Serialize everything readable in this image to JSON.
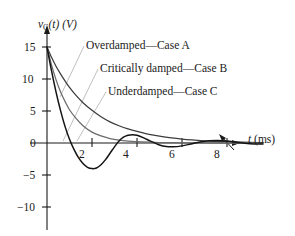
{
  "figure": {
    "y_axis_title_main": "v",
    "y_axis_title_sub": "C",
    "y_axis_title_rest": "(t) (V)",
    "x_axis_title_main": "t",
    "x_axis_title_rest": " (ms)"
  },
  "chart_data": {
    "type": "line",
    "title": "",
    "xlabel": "t (ms)",
    "ylabel": "v_C(t) (V)",
    "xlim": [
      0,
      9.6
    ],
    "ylim": [
      -10,
      16
    ],
    "xticks": [
      2,
      4,
      6,
      8
    ],
    "yticks": [
      15,
      10,
      5,
      0,
      -5,
      -10
    ],
    "xtick_labels": [
      "2",
      "4",
      "6",
      "8"
    ],
    "ytick_labels": [
      "15",
      "10",
      "5",
      "0",
      "−5",
      "−10"
    ],
    "grid": false,
    "legend_position": "inline-annotations",
    "initial_value": 15,
    "series": [
      {
        "name": "Overdamped—Case A",
        "annotation": "Overdamped—Case A",
        "color": "#3d3d3d",
        "x": [
          0,
          0.2,
          0.4,
          0.6,
          0.8,
          1.0,
          1.3,
          1.6,
          2.0,
          2.4,
          2.8,
          3.2,
          3.6,
          4.0,
          4.6,
          5.2,
          6.0,
          7.0,
          8.0,
          9.0,
          9.6
        ],
        "y": [
          15.0,
          13.4,
          12.0,
          10.8,
          9.7,
          8.7,
          7.4,
          6.3,
          5.1,
          4.1,
          3.3,
          2.7,
          2.2,
          1.8,
          1.3,
          0.95,
          0.6,
          0.35,
          0.2,
          0.1,
          0.07
        ]
      },
      {
        "name": "Critically damped—Case B",
        "annotation": "Critically damped—Case B",
        "color": "#6b6b6b",
        "x": [
          0,
          0.2,
          0.4,
          0.6,
          0.8,
          1.0,
          1.3,
          1.6,
          2.0,
          2.4,
          2.8,
          3.2,
          3.6,
          4.2,
          5.0,
          6.0,
          7.0,
          8.0,
          9.0,
          9.6
        ],
        "y": [
          15.0,
          12.2,
          9.9,
          8.0,
          6.5,
          5.2,
          3.8,
          2.7,
          1.7,
          1.1,
          0.7,
          0.45,
          0.3,
          0.16,
          0.07,
          0.03,
          0.01,
          0.0,
          0.0,
          0.0
        ]
      },
      {
        "name": "Underdamped—Case C",
        "annotation": "Underdamped—Case C",
        "color": "#141414",
        "x": [
          0,
          0.2,
          0.4,
          0.6,
          0.8,
          1.0,
          1.2,
          1.4,
          1.6,
          1.8,
          2.0,
          2.2,
          2.4,
          2.6,
          2.8,
          3.0,
          3.2,
          3.4,
          3.6,
          3.8,
          4.0,
          4.3,
          4.6,
          5.0,
          5.3,
          5.6,
          6.0,
          6.4,
          6.8,
          7.2,
          7.6,
          8.0,
          8.4,
          8.8,
          9.2,
          9.6
        ],
        "y": [
          15.0,
          11.3,
          8.0,
          5.1,
          2.6,
          0.6,
          -1.0,
          -2.3,
          -3.2,
          -3.8,
          -4.0,
          -3.9,
          -3.4,
          -2.6,
          -1.6,
          -0.6,
          0.3,
          0.9,
          1.2,
          1.3,
          1.2,
          0.8,
          0.3,
          -0.3,
          -0.55,
          -0.6,
          -0.45,
          -0.15,
          0.15,
          0.35,
          0.4,
          0.3,
          0.12,
          -0.05,
          -0.15,
          -0.15
        ]
      }
    ],
    "annotation_leaders": [
      {
        "label": "Overdamped—Case A",
        "from": [
          84,
          46
        ],
        "to": [
          60,
          96
        ]
      },
      {
        "label": "Critically damped—Case B",
        "from": [
          98,
          69
        ],
        "to": [
          62,
          142
        ]
      },
      {
        "label": "Underdamped—Case C",
        "from": [
          106,
          92
        ],
        "to": [
          76,
          142
        ]
      },
      {
        "label": "x-axis-curve-pointer",
        "from": [
          232,
          146
        ],
        "to": [
          220,
          135
        ]
      }
    ]
  }
}
